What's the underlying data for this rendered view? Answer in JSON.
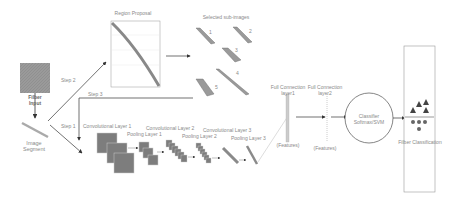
{
  "nodes": {
    "filter_input": {
      "label_line1": "Filber",
      "label_line2": "Input"
    },
    "image_segment": {
      "label_line1": "Image",
      "label_line2": "Segment"
    },
    "region_proposal": {
      "label": "Region Proposal"
    },
    "selected_subimages": {
      "label": "Selected sub-images",
      "items": [
        "1",
        "2",
        "3",
        "4",
        "5"
      ]
    },
    "cnn": {
      "conv1": "Convolutional Layer 1",
      "pool1": "Pooling Layer 1",
      "conv2": "Convolutional Layer 2",
      "pool2": "Pooling Layer 2",
      "conv3": "Convolutional Layer 3",
      "pool3": "Pooling Layer 3"
    },
    "fc1": {
      "label_line1": "Full Connection",
      "label_line2": "layer1",
      "features": "(Features)"
    },
    "fc2": {
      "label_line1": "Full Connection",
      "label_line2": "layer2",
      "features": "(Features)"
    },
    "classifier": {
      "label_line1": "Classifier",
      "label_line2": "Softmax/SVM"
    },
    "output": {
      "label": "Filber Classification"
    }
  },
  "edges": {
    "step1": "Step 1",
    "step2": "Step 2",
    "step3": "Step 3"
  },
  "colors": {
    "block": "#7d7d7d",
    "line": "#333333",
    "light": "#bdbdbd"
  }
}
